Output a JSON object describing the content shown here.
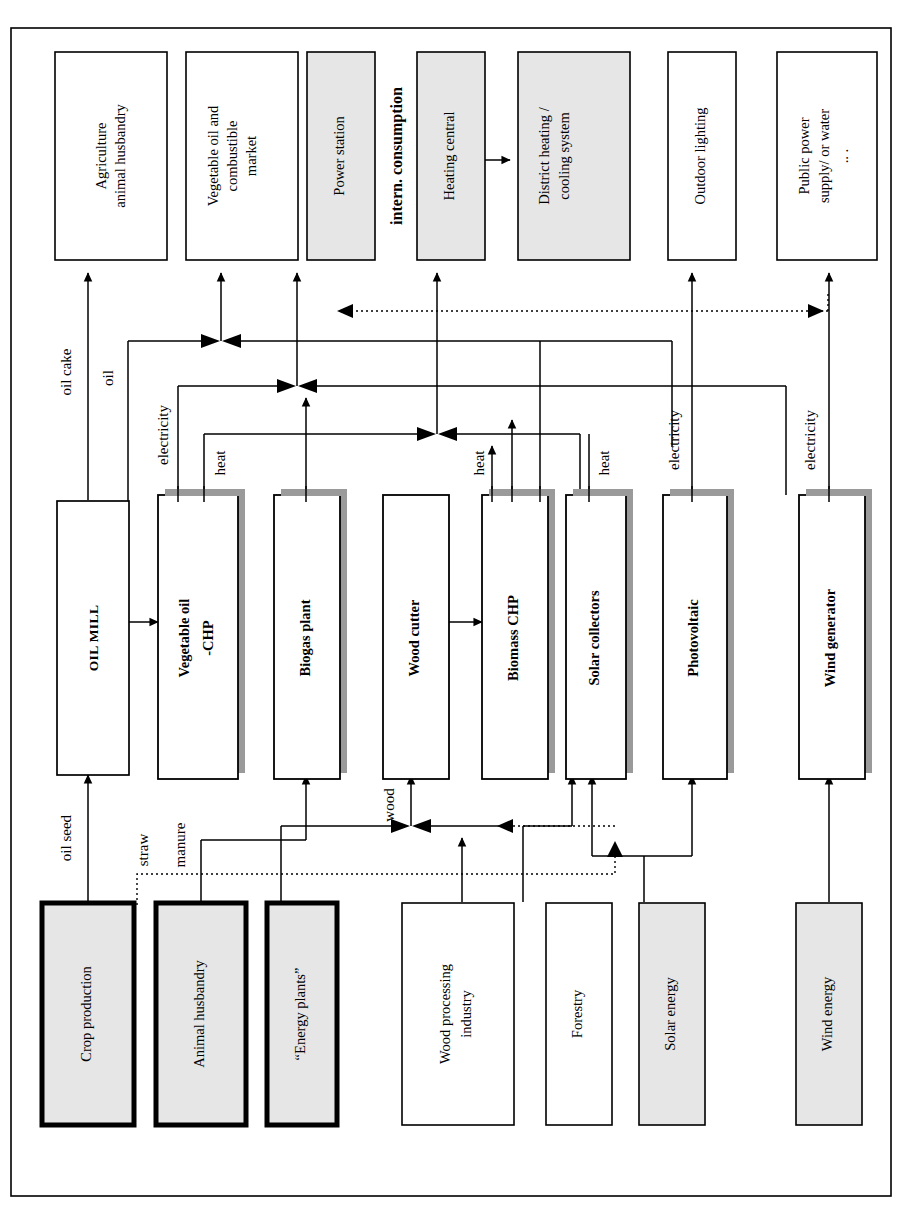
{
  "diagram": {
    "title_label": "intern. consumption",
    "frame": {
      "stroke": "#000000"
    },
    "colors": {
      "grayfill": "#e6e6e6",
      "shadow": "#9a9a9a",
      "stroke": "#000000",
      "white": "#ffffff"
    },
    "consumers": [
      {
        "id": "agriculture",
        "label_lines": [
          "Agriculture",
          "animal husbandry"
        ],
        "fill": "white",
        "bold": false
      },
      {
        "id": "veg-oil-market",
        "label_lines": [
          "Vegetable oil and",
          "combustible",
          "market"
        ],
        "fill": "white",
        "bold": false
      },
      {
        "id": "power-station",
        "label_lines": [
          "Power station"
        ],
        "fill": "gray",
        "bold": false
      },
      {
        "id": "heating-central",
        "label_lines": [
          "Heating central"
        ],
        "fill": "gray",
        "bold": false
      },
      {
        "id": "district-heating",
        "label_lines": [
          "District heating /",
          "cooling system"
        ],
        "fill": "gray",
        "bold": false
      },
      {
        "id": "outdoor-lighting",
        "label_lines": [
          "Outdoor lighting"
        ],
        "fill": "white",
        "bold": false
      },
      {
        "id": "public-power",
        "label_lines": [
          "Public power",
          "supply/ or water",
          ".. ."
        ],
        "fill": "white",
        "bold": false
      }
    ],
    "converters": [
      {
        "id": "oil-mill",
        "label_lines": [
          "OIL MILL"
        ],
        "style": "smallcaps",
        "shadow": false
      },
      {
        "id": "vegetable-oil-chp",
        "label_lines": [
          "Vegetable oil",
          "-CHP"
        ],
        "style": "bold",
        "shadow": true
      },
      {
        "id": "biogas-plant",
        "label_lines": [
          "Biogas plant"
        ],
        "style": "bold",
        "shadow": true
      },
      {
        "id": "wood-cutter",
        "label_lines": [
          "Wood cutter"
        ],
        "style": "bold",
        "shadow": false
      },
      {
        "id": "biomass-chp",
        "label_lines": [
          "Biomass CHP"
        ],
        "style": "bold",
        "shadow": true
      },
      {
        "id": "solar-collectors",
        "label_lines": [
          "Solar collectors"
        ],
        "style": "bold",
        "shadow": true
      },
      {
        "id": "photovoltaic",
        "label_lines": [
          "Photovoltaic"
        ],
        "style": "bold",
        "shadow": true
      },
      {
        "id": "wind-generator",
        "label_lines": [
          "Wind  generator"
        ],
        "style": "bold",
        "shadow": true
      }
    ],
    "sources": [
      {
        "id": "crop-production",
        "label_lines": [
          "Crop production"
        ],
        "fill": "gray",
        "emphasis": true
      },
      {
        "id": "animal-husbandry",
        "label_lines": [
          "Animal husbandry"
        ],
        "fill": "gray",
        "emphasis": true
      },
      {
        "id": "energy-plants",
        "label_lines": [
          "“Energy plants”"
        ],
        "fill": "gray",
        "emphasis": true
      },
      {
        "id": "wood-processing-industry",
        "label_lines": [
          "Wood processing",
          "industry"
        ],
        "fill": "white",
        "emphasis": false
      },
      {
        "id": "forestry",
        "label_lines": [
          "Forestry"
        ],
        "fill": "white",
        "emphasis": false
      },
      {
        "id": "solar-energy",
        "label_lines": [
          "Solar energy"
        ],
        "fill": "gray",
        "emphasis": false
      },
      {
        "id": "wind-energy",
        "label_lines": [
          "Wind energy"
        ],
        "fill": "gray",
        "emphasis": false
      }
    ],
    "flow_labels": [
      {
        "id": "oil-cake",
        "text": "oil cake"
      },
      {
        "id": "oil",
        "text": "oil"
      },
      {
        "id": "electricity-1",
        "text": "electricity"
      },
      {
        "id": "heat-1",
        "text": "heat"
      },
      {
        "id": "heat-2",
        "text": "heat"
      },
      {
        "id": "heat-3",
        "text": "heat"
      },
      {
        "id": "electricity-2",
        "text": "electricity"
      },
      {
        "id": "electricity-3",
        "text": "electricity"
      },
      {
        "id": "oil-seed",
        "text": "oil seed"
      },
      {
        "id": "straw",
        "text": "straw"
      },
      {
        "id": "manure",
        "text": "manure"
      },
      {
        "id": "wood",
        "text": "wood"
      }
    ]
  }
}
